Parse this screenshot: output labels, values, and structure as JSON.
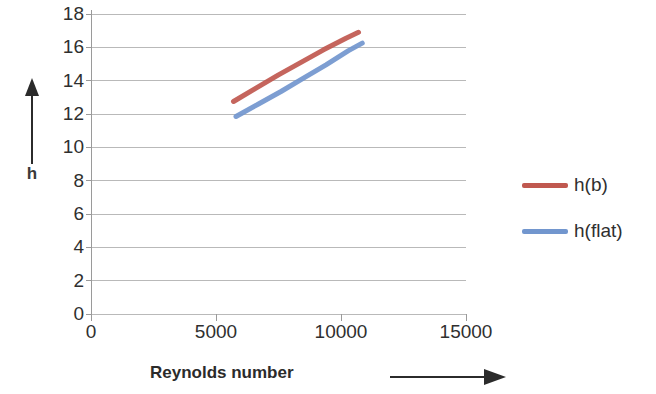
{
  "chart_data": {
    "type": "line",
    "title": "",
    "xlabel": "Reynolds number",
    "ylabel": "h",
    "xlim": [
      0,
      15000
    ],
    "ylim": [
      0,
      18
    ],
    "xticks": [
      "0",
      "5000",
      "10000",
      "15000"
    ],
    "xtick_values": [
      0,
      5000,
      10000,
      15000
    ],
    "yticks": [
      "0",
      "2",
      "4",
      "6",
      "8",
      "10",
      "12",
      "14",
      "16",
      "18"
    ],
    "ytick_values": [
      0,
      2,
      4,
      6,
      8,
      10,
      12,
      14,
      16,
      18
    ],
    "grid": "horizontal",
    "legend_position": "right",
    "series": [
      {
        "name": "h(b)",
        "color": "#C0584F",
        "x": [
          5700,
          6600,
          7500,
          8400,
          9300,
          10200,
          10700
        ],
        "values": [
          12.75,
          13.55,
          14.35,
          15.1,
          15.85,
          16.55,
          16.9
        ]
      },
      {
        "name": "h(flat)",
        "color": "#7296CE",
        "x": [
          5800,
          6700,
          7600,
          8500,
          9400,
          10300,
          10850
        ],
        "values": [
          11.85,
          12.6,
          13.35,
          14.15,
          14.95,
          15.8,
          16.25
        ]
      }
    ]
  },
  "axes": {
    "y_axis_title": "h",
    "y_axis_arrow": "up-arrow-icon",
    "x_axis_title": "Reynolds number",
    "x_axis_arrow": "right-arrow-icon"
  },
  "legend": {
    "entries": [
      {
        "label": "h(b)",
        "color": "#C0584F"
      },
      {
        "label": "h(flat)",
        "color": "#7296CE"
      }
    ]
  },
  "colors": {
    "series_hb": "#C0584F",
    "series_hflat": "#7296CE",
    "gridline": "#b9b9b9",
    "axis": "#9a9a9a",
    "text": "#2f2f2f",
    "background": "#ffffff"
  }
}
